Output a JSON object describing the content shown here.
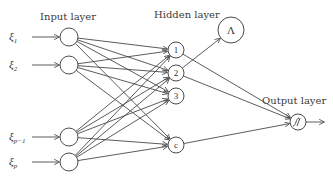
{
  "diagram": {
    "layers": {
      "input": {
        "label": "Input layer",
        "nodes": [
          {
            "id": "x1",
            "var": "ξ",
            "sub": "1"
          },
          {
            "id": "x2",
            "var": "ξ",
            "sub": "2"
          },
          {
            "id": "xp1",
            "var": "ξ",
            "sub": "p−1"
          },
          {
            "id": "xp",
            "var": "ξ",
            "sub": "p"
          }
        ]
      },
      "hidden": {
        "label": "Hidden layer",
        "nodes": [
          {
            "id": "h1",
            "text": "1"
          },
          {
            "id": "h2",
            "text": "2"
          },
          {
            "id": "h3",
            "text": "3"
          },
          {
            "id": "hc",
            "text": "c"
          }
        ]
      },
      "lambda": {
        "id": "lam",
        "text": "Λ"
      },
      "output": {
        "label": "Output layer",
        "node": {
          "id": "out",
          "symbol": "sigmoid"
        }
      }
    },
    "connections": {
      "input_to_hidden": "fully-connected",
      "hidden_to_output": [
        "h1",
        "h2",
        "hc"
      ],
      "hidden_to_lambda": [
        "h2"
      ]
    }
  }
}
